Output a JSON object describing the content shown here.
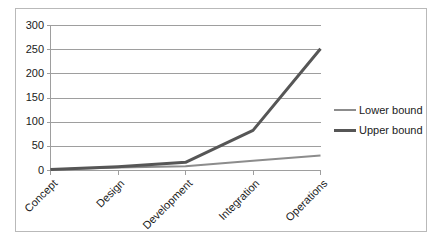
{
  "chart_data": {
    "type": "line",
    "title": "",
    "xlabel": "",
    "ylabel": "",
    "categories": [
      "Concept",
      "Design",
      "Development",
      "Integration",
      "Operations"
    ],
    "series": [
      {
        "name": "Lower bound",
        "values": [
          2,
          6,
          9,
          20,
          31
        ],
        "color": "#8c8c8c",
        "width": 2
      },
      {
        "name": "Upper bound",
        "values": [
          2,
          8,
          17,
          83,
          252
        ],
        "color": "#565656",
        "width": 3
      }
    ],
    "ylim": [
      0,
      300
    ],
    "yticks": [
      0,
      50,
      100,
      150,
      200,
      250,
      300
    ],
    "ytick_labels": [
      "0",
      "50",
      "100",
      "150",
      "200",
      "250",
      "300"
    ],
    "grid": "horizontal",
    "legend_position": "right",
    "plot_border": "none",
    "chart_border_color": "#b9b9b9",
    "gridline_color": "#9e9e9e",
    "axis_color": "#9e9e9e",
    "text_color": "#1a1a1a",
    "background": "#ffffff"
  },
  "legend": {
    "entries": [
      {
        "label": "Lower bound"
      },
      {
        "label": "Upper bound"
      }
    ]
  }
}
